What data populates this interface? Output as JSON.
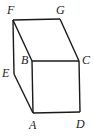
{
  "figure": {
    "type": "prism-drawing",
    "vertices": [
      {
        "id": "F",
        "label": "F",
        "x": 13,
        "y": 20,
        "lx": 7,
        "ly": 14
      },
      {
        "id": "G",
        "label": "G",
        "x": 60,
        "y": 19,
        "lx": 56,
        "ly": 14
      },
      {
        "id": "B",
        "label": "B",
        "x": 32,
        "y": 61,
        "lx": 21,
        "ly": 64
      },
      {
        "id": "C",
        "label": "C",
        "x": 79,
        "y": 61,
        "lx": 82,
        "ly": 64
      },
      {
        "id": "E",
        "label": "E",
        "x": 14,
        "y": 74,
        "lx": 2,
        "ly": 77
      },
      {
        "id": "A",
        "label": "A",
        "x": 33,
        "y": 113,
        "lx": 29,
        "ly": 129
      },
      {
        "id": "D",
        "label": "D",
        "x": 80,
        "y": 112,
        "lx": 76,
        "ly": 128
      }
    ],
    "edges": [
      [
        "F",
        "G"
      ],
      [
        "G",
        "C"
      ],
      [
        "F",
        "B"
      ],
      [
        "B",
        "C"
      ],
      [
        "F",
        "E"
      ],
      [
        "E",
        "A"
      ],
      [
        "B",
        "A"
      ],
      [
        "C",
        "D"
      ],
      [
        "A",
        "D"
      ]
    ]
  }
}
